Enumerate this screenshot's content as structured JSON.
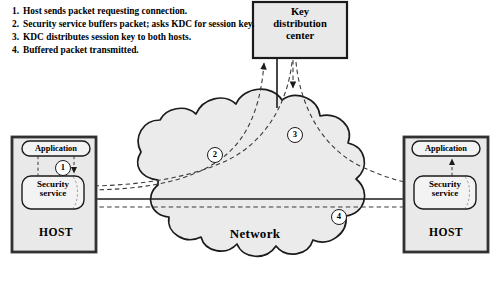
{
  "figure": {
    "colors": {
      "ink": "#1b1b1b",
      "box_fill": "#e9e9e9",
      "cloud_fill": "#ebebeb",
      "pill_fill": "#f3f3f3",
      "page_bg": "#ffffff"
    }
  },
  "steps": [
    {
      "num": "1.",
      "text": "Host sends packet requesting connection."
    },
    {
      "num": "2.",
      "text": "Security service buffers packet; asks KDC for session key."
    },
    {
      "num": "3.",
      "text": "KDC distributes session key to both hosts."
    },
    {
      "num": "4.",
      "text": "Buffered packet transmitted."
    }
  ],
  "nodes": {
    "kdc": {
      "label": "Key\ndistribution\ncenter"
    },
    "network": {
      "label": "Network"
    },
    "host_left": {
      "label": "HOST",
      "application": "Application",
      "security_service": "Security\nservice"
    },
    "host_right": {
      "label": "HOST",
      "application": "Application",
      "security_service": "Security\nservice"
    }
  },
  "markers": [
    {
      "id": "1",
      "label": "1"
    },
    {
      "id": "2",
      "label": "2"
    },
    {
      "id": "3",
      "label": "3"
    },
    {
      "id": "4",
      "label": "4"
    }
  ]
}
